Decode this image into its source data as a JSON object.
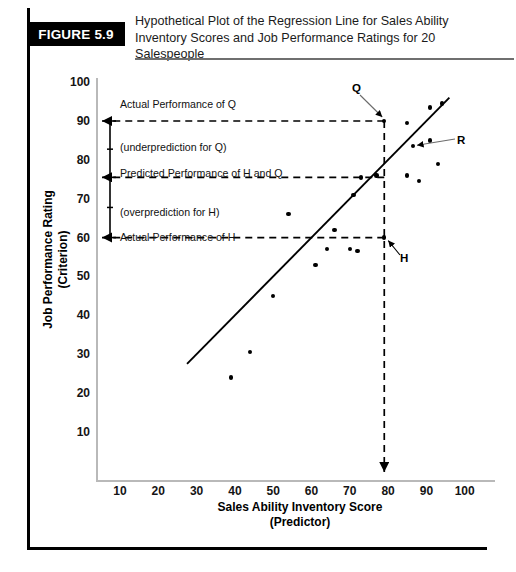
{
  "figure": {
    "tag": "FIGURE 5.9",
    "title": "Hypothetical Plot of the Regression Line for Sales Ability Inventory Scores and Job Performance Ratings for 20 Salespeople"
  },
  "chart_data": {
    "type": "scatter",
    "title": "Hypothetical Plot of the Regression Line for Sales Ability Inventory Scores and Job Performance Ratings for 20 Salespeople",
    "xlabel": "Sales Ability Inventory Score",
    "xlabel_sub": "(Predictor)",
    "ylabel": "Job Performance Rating",
    "ylabel_sub": "(Criterion)",
    "xlim": [
      0,
      103
    ],
    "ylim": [
      0,
      103
    ],
    "xticks": [
      10,
      20,
      30,
      40,
      50,
      60,
      70,
      80,
      90,
      100
    ],
    "yticks": [
      10,
      20,
      30,
      40,
      50,
      60,
      70,
      80,
      90,
      100
    ],
    "grid": false,
    "legend": "none",
    "points": [
      {
        "x": 39,
        "y": 24
      },
      {
        "x": 44,
        "y": 30.5
      },
      {
        "x": 50,
        "y": 45
      },
      {
        "x": 54,
        "y": 66
      },
      {
        "x": 61,
        "y": 53
      },
      {
        "x": 64,
        "y": 57
      },
      {
        "x": 66,
        "y": 62
      },
      {
        "x": 70,
        "y": 57
      },
      {
        "x": 71,
        "y": 71
      },
      {
        "x": 72,
        "y": 56.5
      },
      {
        "x": 73,
        "y": 75.5
      },
      {
        "x": 77,
        "y": 76
      },
      {
        "x": 79,
        "y": 60,
        "label": "H"
      },
      {
        "x": 79,
        "y": 90,
        "label": "Q"
      },
      {
        "x": 85,
        "y": 76
      },
      {
        "x": 85,
        "y": 89.5
      },
      {
        "x": 86.5,
        "y": 83.5,
        "label": "R"
      },
      {
        "x": 88,
        "y": 74.5
      },
      {
        "x": 91,
        "y": 93.5
      },
      {
        "x": 91,
        "y": 85
      },
      {
        "x": 93,
        "y": 79
      },
      {
        "x": 94,
        "y": 94.5
      }
    ],
    "regression_line": {
      "x1": 27.5,
      "y1": 27.5,
      "x2": 96,
      "y2": 96
    }
  },
  "annotations": {
    "actual_q": "Actual Performance of Q",
    "underprediction_q": "(underprediction for Q)",
    "predicted_hq": "Predicted Performance of H and Q",
    "overprediction_h": "(overprediction for H)",
    "actual_h": "Actual Performance of H",
    "label_q": "Q",
    "label_r": "R",
    "label_h": "H",
    "reference_lines": {
      "actual_q_y": 90,
      "predicted_y": 75.5,
      "actual_h_y": 60,
      "score_x": 79
    }
  }
}
